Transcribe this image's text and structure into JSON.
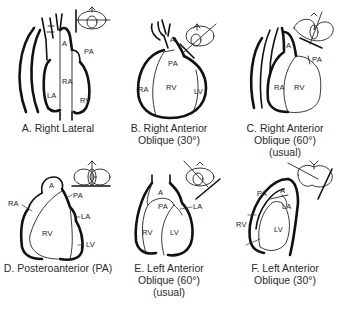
{
  "figure": {
    "panels": [
      {
        "id": "A",
        "caption_lines": [
          "A. Right Lateral"
        ],
        "labels": {
          "a": "A",
          "pa": "PA",
          "ra": "RA",
          "la": "LA",
          "rv": "RV"
        },
        "icon": "orientation-right-lateral-icon"
      },
      {
        "id": "B",
        "caption_lines": [
          "B. Right Anterior",
          "Oblique (30°)"
        ],
        "labels": {
          "a": "A",
          "pa": "PA",
          "ra": "RA",
          "rv": "RV",
          "lv": "LV"
        },
        "icon": "orientation-rao30-icon"
      },
      {
        "id": "C",
        "caption_lines": [
          "C. Right Anterior",
          "Oblique (60°)",
          "(usual)"
        ],
        "labels": {
          "a": "A",
          "pa": "PA",
          "ra": "RA",
          "rv": "RV"
        },
        "icon": "orientation-rao60-icon"
      },
      {
        "id": "D",
        "caption_lines": [
          "D. Posteroanterior (PA)"
        ],
        "labels": {
          "a": "A",
          "ra": "RA",
          "pa": "PA",
          "la": "LA",
          "rv": "RV",
          "lv": "LV"
        },
        "icon": "orientation-pa-icon"
      },
      {
        "id": "E",
        "caption_lines": [
          "E. Left Anterior",
          "Oblique (60°)",
          "(usual)"
        ],
        "labels": {
          "a": "A",
          "pa": "PA",
          "la": "LA",
          "rv": "RV",
          "lv": "LV"
        },
        "icon": "orientation-lao60-icon"
      },
      {
        "id": "F",
        "caption_lines": [
          "F. Left Anterior",
          "Oblique (30°)"
        ],
        "labels": {
          "pa": "PA",
          "a": "A",
          "la": "LA",
          "rv": "RV",
          "lv": "LV"
        },
        "icon": "orientation-lao30-icon"
      }
    ]
  }
}
